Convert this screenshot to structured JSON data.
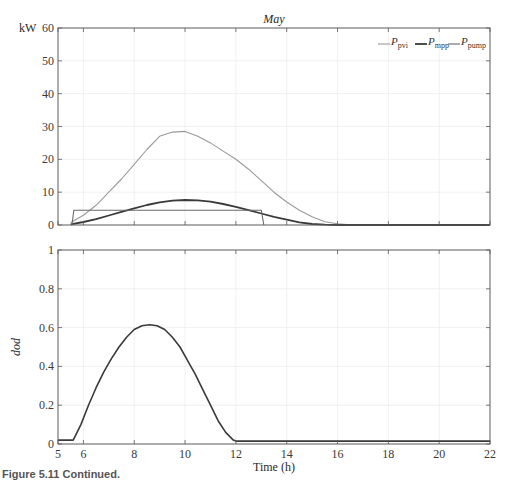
{
  "figure": {
    "caption": "Figure 5.11  Continued."
  },
  "chart_data": [
    {
      "type": "line",
      "title": "May",
      "xlabel": "",
      "ylabel": "kW",
      "xlim": [
        5,
        22
      ],
      "ylim": [
        0,
        60
      ],
      "yticks": [
        0,
        10,
        20,
        30,
        40,
        50,
        60
      ],
      "xticks": [
        5,
        6,
        8,
        10,
        12,
        14,
        16,
        18,
        20,
        22
      ],
      "xtick_labels_visible": false,
      "grid": true,
      "legend": {
        "position": "top-right",
        "entries": [
          "P_pvi",
          "P_mpp",
          "P_pump"
        ]
      },
      "series": [
        {
          "name": "P_pvi",
          "label_main": "P",
          "label_sub": "pvi",
          "color": "#9a9a9a",
          "width": 1.1,
          "x": [
            5.5,
            6.0,
            6.5,
            7.0,
            7.5,
            8.0,
            8.5,
            9.0,
            9.5,
            10.0,
            10.5,
            11.0,
            11.5,
            12.0,
            12.5,
            13.0,
            13.5,
            14.0,
            14.5,
            15.0,
            15.5,
            16.0,
            16.5,
            17.0,
            17.5,
            18.0,
            18.5,
            19.0,
            22.0
          ],
          "y": [
            0.8,
            3.0,
            6.0,
            10.0,
            14.0,
            18.5,
            23.0,
            27.0,
            28.3,
            28.5,
            27.0,
            25.0,
            22.5,
            20.0,
            17.0,
            13.5,
            10.0,
            7.0,
            4.5,
            2.5,
            1.0,
            0.4,
            0.1,
            0.0,
            0.0,
            0.0,
            0.0,
            0.0,
            0.0
          ]
        },
        {
          "name": "P_mpp",
          "label_main": "P",
          "label_sub": "mpp",
          "color": "#3a3a3a",
          "width": 1.8,
          "x": [
            5.5,
            6.0,
            6.5,
            7.0,
            7.5,
            8.0,
            8.5,
            9.0,
            9.5,
            10.0,
            10.5,
            11.0,
            11.5,
            12.0,
            12.5,
            13.0,
            13.5,
            14.0,
            14.5,
            15.0,
            15.5,
            16.0,
            16.5,
            17.0,
            17.5,
            18.0,
            18.5,
            19.0,
            22.0
          ],
          "y": [
            0.2,
            0.9,
            1.8,
            2.9,
            4.0,
            5.1,
            6.1,
            6.9,
            7.4,
            7.6,
            7.5,
            7.1,
            6.4,
            5.5,
            4.5,
            3.5,
            2.5,
            1.6,
            0.8,
            0.3,
            0.1,
            0.0,
            0.0,
            0.0,
            0.0,
            0.0,
            0.0,
            0.0,
            0.0
          ]
        },
        {
          "name": "P_pump",
          "label_main": "P",
          "label_sub": "pump",
          "color": "#6a6a6a",
          "width": 1.1,
          "x": [
            5.55,
            5.62,
            13.0,
            13.1
          ],
          "y": [
            0.0,
            4.5,
            4.5,
            0.0
          ]
        }
      ]
    },
    {
      "type": "line",
      "title": "",
      "xlabel": "Time (h)",
      "ylabel": "dod",
      "xlim": [
        5,
        22
      ],
      "ylim": [
        0,
        1
      ],
      "yticks": [
        0,
        0.2,
        0.4,
        0.6,
        0.8,
        1
      ],
      "ytick_labels": [
        "0",
        "0.2",
        "0.4",
        "0.6",
        "0.8",
        "1"
      ],
      "xticks": [
        5,
        6,
        8,
        10,
        12,
        14,
        16,
        18,
        20,
        22
      ],
      "xtick_labels": [
        "5",
        "6",
        "8",
        "10",
        "12",
        "14",
        "16",
        "18",
        "20",
        "22"
      ],
      "grid": true,
      "series": [
        {
          "name": "dod",
          "color": "#3a3a3a",
          "width": 1.6,
          "x": [
            5.0,
            5.6,
            5.9,
            6.2,
            6.5,
            6.8,
            7.1,
            7.4,
            7.7,
            8.0,
            8.3,
            8.6,
            8.9,
            9.2,
            9.5,
            9.8,
            10.1,
            10.4,
            10.7,
            11.0,
            11.3,
            11.6,
            11.9,
            12.0,
            22.0
          ],
          "y": [
            0.02,
            0.02,
            0.1,
            0.2,
            0.29,
            0.37,
            0.44,
            0.5,
            0.55,
            0.59,
            0.61,
            0.615,
            0.61,
            0.59,
            0.55,
            0.5,
            0.43,
            0.36,
            0.28,
            0.2,
            0.12,
            0.06,
            0.02,
            0.015,
            0.015
          ]
        }
      ]
    }
  ]
}
